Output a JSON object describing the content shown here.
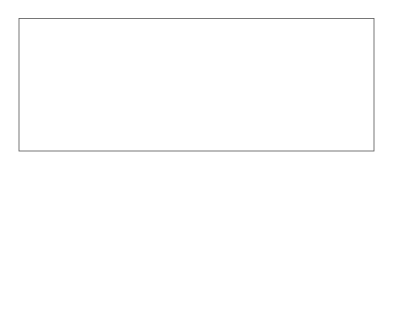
{
  "chart_data": [
    {
      "type": "line",
      "name": "continuous-recording",
      "title": "",
      "xlabel": "",
      "ylabel": "",
      "description": "Long continuous noisy time series with three dotted-outline windows marking epochs extracted around events",
      "grid": false,
      "epoch_windows": [
        {
          "left_px": 45,
          "zero_px": 72,
          "right_px": 112
        },
        {
          "left_px": 152,
          "zero_px": 179,
          "right_px": 219
        },
        {
          "left_px": 258,
          "zero_px": 285,
          "right_px": 326
        }
      ],
      "seed": 7,
      "n_samples": 720,
      "amplitude": 1.0
    },
    {
      "type": "line",
      "name": "epoch-1",
      "xlabel": "Latency (s)",
      "ylabel": "",
      "xlim": [
        -1,
        1.5
      ],
      "xticks": [
        "-1",
        "-0.5",
        "0",
        "0.5",
        "1",
        "1.5"
      ],
      "zero_line": 0,
      "seed": 11,
      "n_samples": 160
    },
    {
      "type": "line",
      "name": "epoch-2",
      "xlabel": "Latency (s)",
      "ylabel": "",
      "xlim": [
        -1,
        1.5
      ],
      "xticks": [
        "-1",
        "-0.5",
        "0",
        "0.5",
        "1",
        "1.5"
      ],
      "zero_line": 0,
      "seed": 23,
      "n_samples": 160
    },
    {
      "type": "line",
      "name": "epoch-3",
      "xlabel": "Latency (s)",
      "ylabel": "",
      "xlim": [
        -1,
        1.5
      ],
      "xticks": [
        "-1",
        "-0.5",
        "0",
        "0.5",
        "1",
        "1.5"
      ],
      "zero_line": 0,
      "seed": 37,
      "n_samples": 160
    }
  ],
  "colors": {
    "signal": "#111111",
    "frame": "#555555",
    "dotted": "#444444",
    "zero_line": "#888888"
  }
}
